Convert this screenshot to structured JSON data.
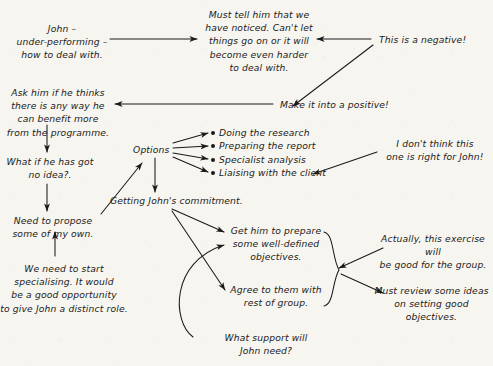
{
  "diagram": {
    "ink_color": "#1a1a1a",
    "paper_color": "#f7f5f0",
    "nodes": {
      "john_problem": "John –\nunder-performing –\nhow to deal with.",
      "must_tell": "Must tell him that we\nhave noticed. Can't let\nthings go on or it will\nbecome even harder\nto deal with.",
      "this_is_negative": "This is a negative!",
      "make_positive": "Make it into a positive!",
      "ask_him": "Ask him if he thinks\nthere is any way he\ncan benefit more\nfrom the programme.",
      "what_if_no_idea": "What if he has got\nno idea?.",
      "need_to_propose": "Need to propose\nsome of my own.",
      "we_need_specialising": "We need to start\nspecialising. It would\nbe a good opportunity\nto give John a distinct role.",
      "options": "Options",
      "dont_think_right": "I don't think this\none is right for John!",
      "getting_commitment": "Getting John's commitment.",
      "get_him_prepare": "Get him to prepare\nsome well-defined\nobjectives.",
      "agree_with_group": "Agree to them with\nrest of group.",
      "what_support": "What support will\nJohn need?",
      "actually_exercise": "Actually, this exercise will\nbe good for the group.",
      "must_review": "Must review some ideas\non setting good objectives."
    },
    "options_list": [
      "Doing the research",
      "Preparing the report",
      "Specialist analysis",
      "Liaising with the client"
    ]
  }
}
